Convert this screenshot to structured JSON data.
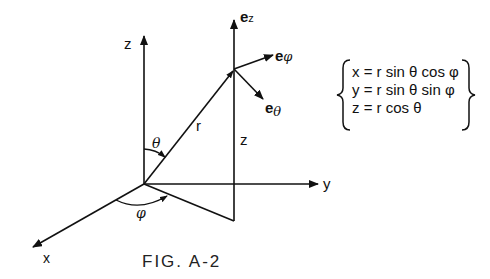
{
  "figure": {
    "caption": "FIG. A-2",
    "axes": {
      "z_label": "z",
      "y_label": "y",
      "x_label": "x"
    },
    "vectors": {
      "r_label": "r",
      "height_label": "z",
      "unit_ez": "e",
      "unit_ez_sub": "z",
      "unit_ephi": "e",
      "unit_ephi_sub": "φ",
      "unit_etheta": "e",
      "unit_etheta_sub": "θ"
    },
    "angles": {
      "theta": "θ",
      "phi": "φ"
    },
    "equations": [
      "x = r  sin θ cos φ",
      "y = r  sin θ sin φ",
      "z = r  cos θ"
    ]
  },
  "colors": {
    "ink": "#111111",
    "background": "#ffffff"
  }
}
